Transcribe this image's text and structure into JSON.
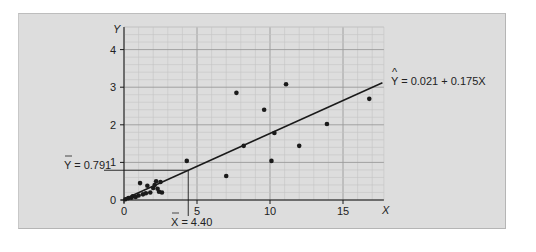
{
  "chart_data": {
    "type": "scatter",
    "title": "",
    "xlabel": "X",
    "ylabel": "Y",
    "xlim": [
      0,
      17.8
    ],
    "ylim": [
      0,
      4.6
    ],
    "x_ticks": [
      0,
      5,
      10,
      15
    ],
    "y_ticks": [
      0,
      1,
      2,
      3,
      4
    ],
    "grid": true,
    "points": [
      {
        "x": 0.1,
        "y": 0.02
      },
      {
        "x": 0.3,
        "y": 0.05
      },
      {
        "x": 0.5,
        "y": 0.06
      },
      {
        "x": 0.6,
        "y": 0.1
      },
      {
        "x": 0.8,
        "y": 0.08
      },
      {
        "x": 1.0,
        "y": 0.12
      },
      {
        "x": 1.1,
        "y": 0.45
      },
      {
        "x": 1.3,
        "y": 0.15
      },
      {
        "x": 1.5,
        "y": 0.18
      },
      {
        "x": 1.8,
        "y": 0.2
      },
      {
        "x": 2.0,
        "y": 0.32
      },
      {
        "x": 2.1,
        "y": 0.4
      },
      {
        "x": 2.2,
        "y": 0.5
      },
      {
        "x": 2.3,
        "y": 0.3
      },
      {
        "x": 2.4,
        "y": 0.22
      },
      {
        "x": 2.5,
        "y": 0.48
      },
      {
        "x": 1.6,
        "y": 0.38
      },
      {
        "x": 2.6,
        "y": 0.2
      },
      {
        "x": 4.3,
        "y": 1.04
      },
      {
        "x": 7.0,
        "y": 0.64
      },
      {
        "x": 7.7,
        "y": 2.85
      },
      {
        "x": 8.2,
        "y": 1.44
      },
      {
        "x": 9.6,
        "y": 2.4
      },
      {
        "x": 10.1,
        "y": 1.04
      },
      {
        "x": 10.3,
        "y": 1.78
      },
      {
        "x": 11.1,
        "y": 3.08
      },
      {
        "x": 12.0,
        "y": 1.44
      },
      {
        "x": 13.9,
        "y": 2.02
      },
      {
        "x": 16.8,
        "y": 2.69
      }
    ],
    "regression": {
      "intercept": 0.021,
      "slope": 0.175,
      "x_range": [
        0,
        17.8
      ]
    },
    "annotations": {
      "equation": "Ŷ = 0.021 + 0.175X",
      "mean_y_label": "Ȳ = 0.791",
      "mean_y": 0.791,
      "mean_x_label": "X̄ = 4.40",
      "mean_x": 4.4
    }
  },
  "labels": {
    "x_axis": "X",
    "y_axis": "Y",
    "equation_hat": "^",
    "equation_text": "Y = 0.021 + 0.175X",
    "mean_y_text": "Y = 0.791",
    "mean_x_text": "X = 4.40",
    "x_ticks": [
      "0",
      "5",
      "10",
      "15"
    ],
    "y_ticks": [
      "0",
      "1",
      "2",
      "3",
      "4"
    ]
  },
  "colors": {
    "panel": "#dddddd",
    "grid_major": "#9a9a9a",
    "grid_minor": "#c4c4c4",
    "ink": "#1a1a1a"
  }
}
